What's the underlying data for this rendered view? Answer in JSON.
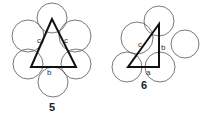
{
  "figures": [
    {
      "number": "5",
      "shape": "isosceles-triangle",
      "labels": {
        "left_side": "c",
        "right_side": "c",
        "base": "b"
      },
      "circle_count": 6
    },
    {
      "number": "6",
      "shape": "right-triangle",
      "labels": {
        "hypotenuse": "c",
        "vertical_leg": "b",
        "base": "a"
      },
      "circle_count": 5
    }
  ],
  "colors": {
    "circle_stroke": "#555555",
    "triangle_stroke": "#111111",
    "background": "#ffffff"
  }
}
